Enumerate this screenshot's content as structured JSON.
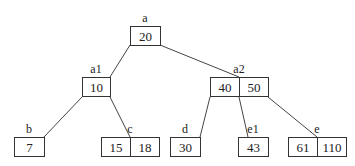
{
  "diagram": {
    "type": "b-tree",
    "nodes": [
      {
        "id": "a",
        "label": "a",
        "keys": [
          "20"
        ],
        "x": 130,
        "y": 26,
        "cellw": 30
      },
      {
        "id": "a1",
        "label": "a1",
        "keys": [
          "10"
        ],
        "x": 82,
        "y": 77,
        "cellw": 28
      },
      {
        "id": "a2",
        "label": "a2",
        "keys": [
          "40",
          "50"
        ],
        "x": 210,
        "y": 77,
        "cellw": 29
      },
      {
        "id": "b",
        "label": "b",
        "keys": [
          "7"
        ],
        "x": 14,
        "y": 137,
        "cellw": 30
      },
      {
        "id": "c",
        "label": "c",
        "keys": [
          "15",
          "18"
        ],
        "x": 101,
        "y": 137,
        "cellw": 29
      },
      {
        "id": "d",
        "label": "d",
        "keys": [
          "30"
        ],
        "x": 170,
        "y": 137,
        "cellw": 30
      },
      {
        "id": "e1",
        "label": "e1",
        "keys": [
          "43"
        ],
        "x": 238,
        "y": 137,
        "cellw": 30
      },
      {
        "id": "e",
        "label": "e",
        "keys": [
          "61",
          "110"
        ],
        "x": 288,
        "y": 137,
        "cellw": 29
      }
    ],
    "edges": [
      {
        "from": "a",
        "to": "a1"
      },
      {
        "from": "a",
        "to": "a2"
      },
      {
        "from": "a1",
        "to": "b"
      },
      {
        "from": "a1",
        "to": "c"
      },
      {
        "from": "a2",
        "to": "d"
      },
      {
        "from": "a2",
        "to": "e1"
      },
      {
        "from": "a2",
        "to": "e"
      }
    ],
    "edge_coords": [
      [
        130,
        45,
        110,
        77
      ],
      [
        160,
        45,
        239,
        77
      ],
      [
        82,
        97,
        44,
        137
      ],
      [
        110,
        97,
        130,
        137
      ],
      [
        210,
        97,
        200,
        137
      ],
      [
        239,
        97,
        248,
        137
      ],
      [
        268,
        97,
        317,
        137
      ]
    ]
  }
}
